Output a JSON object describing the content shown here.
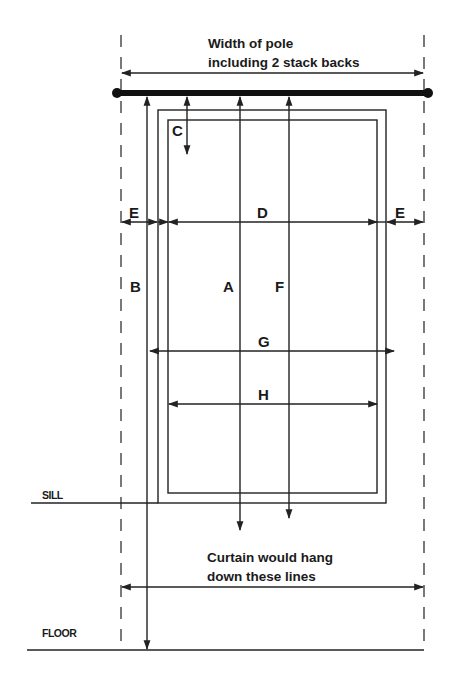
{
  "diagram": {
    "title_top": {
      "line1": "Width of pole",
      "line2": "including 2 stack backs"
    },
    "note_bottom": {
      "line1": "Curtain would hang",
      "line2": "down these lines"
    },
    "levels": {
      "sill": "SILL",
      "floor": "FLOOR"
    },
    "measurements": {
      "A": "A",
      "B": "B",
      "C": "C",
      "D": "D",
      "E_left": "E",
      "E_right": "E",
      "F": "F",
      "G": "G",
      "H": "H"
    },
    "colors": {
      "line": "#222222",
      "pole": "#111111",
      "background": "#ffffff"
    }
  }
}
